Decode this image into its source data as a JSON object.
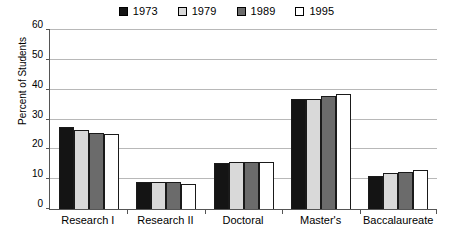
{
  "chart_data": {
    "type": "bar",
    "title": "",
    "xlabel": "",
    "ylabel": "Percent of Students",
    "ylim": [
      0,
      60
    ],
    "yticks": [
      0,
      10,
      20,
      30,
      40,
      50,
      60
    ],
    "grid": true,
    "legend_position": "top-center",
    "categories": [
      "Research I",
      "Research II",
      "Doctoral",
      "Master's",
      "Baccalaureate"
    ],
    "series": [
      {
        "name": "1973",
        "color": "#141414",
        "values": [
          27.5,
          9.2,
          15.5,
          36.8,
          11.2
        ]
      },
      {
        "name": "1979",
        "color": "#d9d9d9",
        "values": [
          26.6,
          9.1,
          15.9,
          36.9,
          12.0
        ]
      },
      {
        "name": "1989",
        "color": "#6b6b6b",
        "values": [
          25.5,
          8.9,
          15.9,
          38.0,
          12.3
        ]
      },
      {
        "name": "1995",
        "color": "#ffffff",
        "values": [
          25.2,
          8.4,
          15.6,
          38.4,
          13.2
        ]
      }
    ]
  },
  "legend": {
    "items": [
      {
        "label": "1973"
      },
      {
        "label": "1979"
      },
      {
        "label": "1989"
      },
      {
        "label": "1995"
      }
    ]
  },
  "axis": {
    "y_title": "Percent of Students",
    "y_tick_labels": [
      "60",
      "50",
      "40",
      "30",
      "20",
      "10",
      "0"
    ],
    "x_tick_labels": [
      "Research I",
      "Research II",
      "Doctoral",
      "Master's",
      "Baccalaureate"
    ]
  }
}
